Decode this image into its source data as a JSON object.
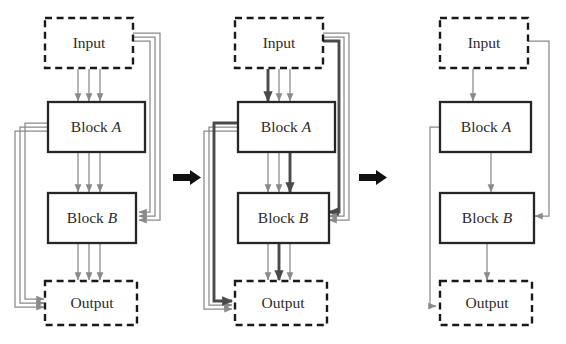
{
  "figure": {
    "type": "flow-diagram",
    "canvas": {
      "width": 566,
      "height": 344
    },
    "node_labels": {
      "input": "Input",
      "output": "Output",
      "block_a_prefix": "Block ",
      "block_a_suffix": "A",
      "block_b_prefix": "Block ",
      "block_b_suffix": "B"
    },
    "colors": {
      "background": "#ffffff",
      "dashed_border": "#191919",
      "solid_border": "#262626",
      "connection_thin": "#8a8a8a",
      "connection_bold": "#4a4a4a",
      "stage_arrow": "#111111",
      "text": "#2b2b2b"
    },
    "stage_arrow_icon": "right-arrow-icon",
    "panels": [
      {
        "id": "panel-1",
        "name": "dense-network-stage",
        "nodes": [
          {
            "id": "input",
            "label": "Input",
            "style": "dashed"
          },
          {
            "id": "block-a",
            "label": "Block A",
            "style": "solid"
          },
          {
            "id": "block-b",
            "label": "Block B",
            "style": "solid"
          },
          {
            "id": "output",
            "label": "Output",
            "style": "dashed"
          }
        ],
        "edge_groups": [
          {
            "from": "input",
            "to": "block-a",
            "count": 3,
            "bold_index": -1
          },
          {
            "from": "block-a",
            "to": "block-b",
            "count": 3,
            "bold_index": -1
          },
          {
            "from": "block-b",
            "to": "output",
            "count": 3,
            "bold_index": -1
          },
          {
            "from": "input",
            "to": "block-b",
            "count": 3,
            "bold_index": -1,
            "route": "right-skip"
          },
          {
            "from": "block-a",
            "to": "output",
            "count": 3,
            "bold_index": -1,
            "route": "left-skip"
          }
        ]
      },
      {
        "id": "panel-2",
        "name": "partially-pruned-stage",
        "nodes": [
          {
            "id": "input",
            "label": "Input",
            "style": "dashed"
          },
          {
            "id": "block-a",
            "label": "Block A",
            "style": "solid"
          },
          {
            "id": "block-b",
            "label": "Block B",
            "style": "solid"
          },
          {
            "id": "output",
            "label": "Output",
            "style": "dashed"
          }
        ],
        "edge_groups": [
          {
            "from": "input",
            "to": "block-a",
            "count": 3,
            "bold_index": 0
          },
          {
            "from": "block-a",
            "to": "block-b",
            "count": 3,
            "bold_index": 2
          },
          {
            "from": "block-b",
            "to": "output",
            "count": 3,
            "bold_index": 1
          },
          {
            "from": "input",
            "to": "block-b",
            "count": 3,
            "bold_index": 0,
            "route": "right-skip"
          },
          {
            "from": "block-a",
            "to": "output",
            "count": 3,
            "bold_index": 2,
            "route": "left-skip"
          }
        ]
      },
      {
        "id": "panel-3",
        "name": "pruned-network-stage",
        "nodes": [
          {
            "id": "input",
            "label": "Input",
            "style": "dashed"
          },
          {
            "id": "block-a",
            "label": "Block A",
            "style": "solid"
          },
          {
            "id": "block-b",
            "label": "Block B",
            "style": "solid"
          },
          {
            "id": "output",
            "label": "Output",
            "style": "dashed"
          }
        ],
        "edge_groups": [
          {
            "from": "input",
            "to": "block-a",
            "count": 1,
            "bold_index": -1
          },
          {
            "from": "block-a",
            "to": "block-b",
            "count": 1,
            "bold_index": -1
          },
          {
            "from": "block-b",
            "to": "output",
            "count": 1,
            "bold_index": -1
          },
          {
            "from": "input",
            "to": "block-b",
            "count": 1,
            "bold_index": -1,
            "route": "right-skip"
          },
          {
            "from": "block-a",
            "to": "output",
            "count": 1,
            "bold_index": -1,
            "route": "left-skip"
          }
        ]
      }
    ],
    "stage_arrows": [
      {
        "id": "arrow-1",
        "between": [
          "panel-1",
          "panel-2"
        ]
      },
      {
        "id": "arrow-2",
        "between": [
          "panel-2",
          "panel-3"
        ]
      }
    ]
  }
}
